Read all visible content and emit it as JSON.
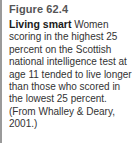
{
  "figure": {
    "label": "Figure 62.4",
    "lead": "Living smart",
    "text": " Women scoring in the highest 25 percent on the Scottish national intelligence test at age 11 tended to live longer than those who scored in the lowest 25 percent. (From Whalley & Deary, 2001.)"
  },
  "colors": {
    "rule": "#9a9a9a",
    "label": "#555555",
    "text": "#333333"
  }
}
